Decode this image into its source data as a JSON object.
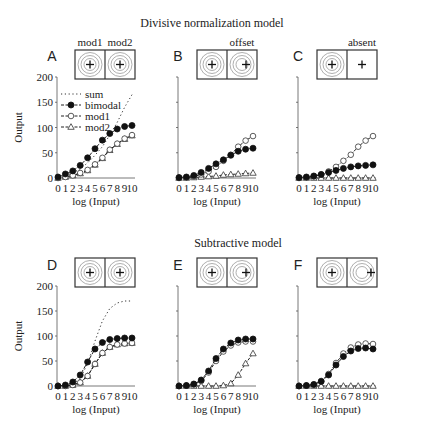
{
  "section_titles": [
    "Divisive normalization model",
    "Subtractive model"
  ],
  "xlabel": "log (Input)",
  "ylabel": "Output",
  "y_ticks": [
    "0",
    "50",
    "100",
    "150",
    "200"
  ],
  "x_ticks": [
    "0",
    "1",
    "2",
    "3",
    "4",
    "5",
    "6",
    "7",
    "8",
    "9",
    "10"
  ],
  "legend": [
    {
      "key": "sum",
      "label": "sum",
      "style": "dotted"
    },
    {
      "key": "bimodal",
      "label": "bimodal",
      "style": "filled-circle"
    },
    {
      "key": "mod1",
      "label": "mod1",
      "style": "open-circle"
    },
    {
      "key": "mod2",
      "label": "mod2",
      "style": "open-triangle"
    }
  ],
  "panels": [
    {
      "letter": "A",
      "stimulus_label": "",
      "box_labels": [
        "mod1",
        "mod2"
      ],
      "stimulus": "centered-both"
    },
    {
      "letter": "B",
      "stimulus_label": "offset",
      "box_labels": [],
      "stimulus": "offset"
    },
    {
      "letter": "C",
      "stimulus_label": "absent",
      "box_labels": [],
      "stimulus": "absent"
    },
    {
      "letter": "D",
      "stimulus_label": "",
      "box_labels": [],
      "stimulus": "centered-both"
    },
    {
      "letter": "E",
      "stimulus_label": "",
      "box_labels": [],
      "stimulus": "offset"
    },
    {
      "letter": "F",
      "stimulus_label": "",
      "box_labels": [],
      "stimulus": "offset-far"
    }
  ],
  "chart_data": [
    {
      "type": "line",
      "panel": "A",
      "title": "Divisive normalization model",
      "xlabel": "log (Input)",
      "ylabel": "Output",
      "ylim": [
        0,
        200
      ],
      "xlim": [
        0,
        10
      ],
      "grid": false,
      "legend_position": "upper left",
      "x": [
        0,
        1,
        2,
        3,
        4,
        5,
        6,
        7,
        8,
        9,
        10
      ],
      "series": [
        {
          "name": "sum",
          "values": [
            2,
            5,
            10,
            18,
            30,
            45,
            62,
            85,
            110,
            140,
            165
          ]
        },
        {
          "name": "bimodal",
          "values": [
            2,
            8,
            14,
            25,
            40,
            58,
            75,
            88,
            97,
            102,
            104
          ]
        },
        {
          "name": "mod1",
          "values": [
            0,
            2,
            5,
            10,
            16,
            27,
            40,
            56,
            68,
            78,
            85
          ]
        },
        {
          "name": "mod2",
          "values": [
            0,
            2,
            5,
            9,
            15,
            26,
            39,
            55,
            67,
            77,
            84
          ]
        }
      ]
    },
    {
      "type": "line",
      "panel": "B",
      "title": "offset",
      "xlabel": "log (Input)",
      "ylabel": "Output",
      "ylim": [
        0,
        200
      ],
      "xlim": [
        0,
        10
      ],
      "grid": false,
      "x": [
        0,
        1,
        2,
        3,
        4,
        5,
        6,
        7,
        8,
        9,
        10
      ],
      "series": [
        {
          "name": "bimodal",
          "values": [
            1,
            2,
            5,
            11,
            19,
            28,
            36,
            45,
            53,
            57,
            59
          ]
        },
        {
          "name": "mod1",
          "values": [
            0,
            1,
            3,
            7,
            13,
            22,
            34,
            46,
            62,
            74,
            83
          ]
        },
        {
          "name": "mod2",
          "values": [
            0,
            0,
            1,
            2,
            3,
            4,
            6,
            7,
            8,
            9,
            10
          ]
        }
      ]
    },
    {
      "type": "line",
      "panel": "C",
      "title": "absent",
      "xlabel": "log (Input)",
      "ylabel": "Output",
      "ylim": [
        0,
        200
      ],
      "xlim": [
        0,
        10
      ],
      "grid": false,
      "x": [
        0,
        1,
        2,
        3,
        4,
        5,
        6,
        7,
        8,
        9,
        10
      ],
      "series": [
        {
          "name": "bimodal",
          "values": [
            1,
            2,
            4,
            7,
            11,
            15,
            19,
            22,
            24,
            25,
            26
          ]
        },
        {
          "name": "mod1",
          "values": [
            0,
            1,
            3,
            7,
            13,
            22,
            34,
            46,
            62,
            74,
            83
          ]
        },
        {
          "name": "mod2",
          "values": [
            0,
            0,
            0,
            0,
            0,
            0,
            0,
            0,
            0,
            0,
            0
          ]
        }
      ]
    },
    {
      "type": "line",
      "panel": "D",
      "title": "Subtractive model",
      "xlabel": "log (Input)",
      "ylabel": "Output",
      "ylim": [
        0,
        200
      ],
      "xlim": [
        0,
        10
      ],
      "grid": false,
      "x": [
        0,
        1,
        2,
        3,
        4,
        5,
        6,
        7,
        8,
        9,
        10
      ],
      "series": [
        {
          "name": "sum",
          "values": [
            0,
            1,
            4,
            15,
            45,
            90,
            130,
            155,
            166,
            170,
            170
          ]
        },
        {
          "name": "bimodal",
          "values": [
            0,
            2,
            8,
            22,
            48,
            74,
            87,
            93,
            95,
            96,
            96
          ]
        },
        {
          "name": "mod1",
          "values": [
            0,
            0,
            2,
            7,
            20,
            44,
            66,
            78,
            83,
            85,
            86
          ]
        },
        {
          "name": "mod2",
          "values": [
            0,
            0,
            2,
            7,
            20,
            44,
            66,
            78,
            83,
            85,
            86
          ]
        }
      ]
    },
    {
      "type": "line",
      "panel": "E",
      "xlabel": "log (Input)",
      "ylabel": "Output",
      "ylim": [
        0,
        200
      ],
      "xlim": [
        0,
        10
      ],
      "grid": false,
      "x": [
        0,
        1,
        2,
        3,
        4,
        5,
        6,
        7,
        8,
        9,
        10
      ],
      "series": [
        {
          "name": "bimodal",
          "values": [
            0,
            1,
            4,
            12,
            30,
            55,
            74,
            86,
            92,
            94,
            94
          ]
        },
        {
          "name": "mod1",
          "values": [
            0,
            1,
            3,
            10,
            27,
            50,
            69,
            81,
            87,
            89,
            89
          ]
        },
        {
          "name": "mod2",
          "values": [
            0,
            0,
            0,
            0,
            0,
            0,
            1,
            5,
            22,
            45,
            65
          ]
        }
      ]
    },
    {
      "type": "line",
      "panel": "F",
      "xlabel": "log (Input)",
      "ylabel": "Output",
      "ylim": [
        0,
        200
      ],
      "xlim": [
        0,
        10
      ],
      "grid": false,
      "x": [
        0,
        1,
        2,
        3,
        4,
        5,
        6,
        7,
        8,
        9,
        10
      ],
      "series": [
        {
          "name": "bimodal",
          "values": [
            0,
            1,
            3,
            9,
            22,
            42,
            59,
            70,
            75,
            76,
            74
          ]
        },
        {
          "name": "mod1",
          "values": [
            0,
            1,
            3,
            10,
            24,
            46,
            65,
            77,
            83,
            85,
            84
          ]
        },
        {
          "name": "mod2",
          "values": [
            0,
            0,
            0,
            0,
            0,
            0,
            0,
            0,
            0,
            0,
            0
          ]
        }
      ]
    }
  ]
}
